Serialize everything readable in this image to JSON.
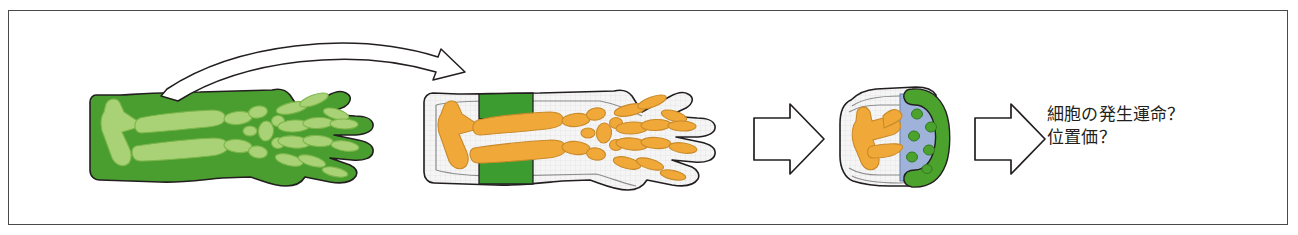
{
  "figure": {
    "frame": {
      "border_color": "#4a4a4a"
    },
    "background_color": "#ffffff",
    "palette": {
      "limb_green_fill": "#4a9e2f",
      "limb_green_bone": "#a8d275",
      "graft_green": "#3d9c30",
      "bone_orange": "#f0a838",
      "bone_orange_stroke": "#c98a2a",
      "tissue_white": "#f4f4f4",
      "progress_zone_blue": "#9fb3da",
      "aer_green": "#4ba32e",
      "outline": "#231f20",
      "text_color": "#231f20"
    },
    "panels": [
      {
        "id": "panel-1",
        "name": "donor-limb-green-labeled",
        "description": "green-labeled donor limb with light green skeletal elements",
        "fill": "#4a9e2f"
      },
      {
        "id": "panel-2",
        "name": "host-limb-with-green-graft",
        "description": "host limb with orange skeleton and green grafted band in stylopod region",
        "fill": "#f4f4f4"
      },
      {
        "id": "panel-3",
        "name": "limb-bud-progress-zone",
        "description": "limb bud with orange skeletal elements, blue progress zone with green cells, green AER cap",
        "fill": "#f4f4f4"
      }
    ],
    "arrows": [
      {
        "name": "graft-transplant-curved-arrow",
        "style": "outlined-curved",
        "from": "panel-1",
        "to": "panel-2"
      },
      {
        "name": "block-arrow-1",
        "style": "outlined-block",
        "from": "panel-2",
        "to": "panel-3"
      },
      {
        "name": "block-arrow-2",
        "style": "outlined-block",
        "from": "panel-3",
        "to": "caption"
      }
    ],
    "caption": {
      "line1": "細胞の発生運命？",
      "line2": "位置価？"
    }
  }
}
